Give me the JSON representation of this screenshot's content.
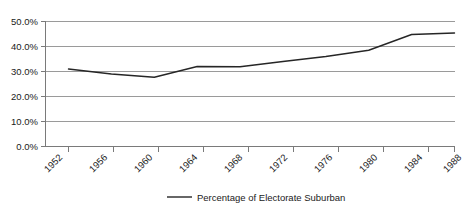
{
  "chart_data": {
    "type": "line",
    "title": "",
    "subtitle": "",
    "xlabel": "",
    "ylabel": "",
    "categories": [
      "1952",
      "1956",
      "1960",
      "1964",
      "1968",
      "1972",
      "1976",
      "1980",
      "1984",
      "1988"
    ],
    "x": [
      1952,
      1956,
      1960,
      1964,
      1968,
      1972,
      1976,
      1980,
      1984,
      1988
    ],
    "series": [
      {
        "name": "Percentage of Electorate Suburban",
        "values": [
          31.0,
          29.0,
          27.7,
          32.0,
          31.9,
          34.0,
          36.0,
          38.5,
          44.8,
          45.4
        ],
        "color": "#262626"
      }
    ],
    "ylim": [
      0,
      50
    ],
    "ytick_values": [
      0,
      10,
      20,
      30,
      40,
      50
    ],
    "ytick_labels": [
      "0.0%",
      "10.0%",
      "20.0%",
      "30.0%",
      "40.0%",
      "50.0%"
    ],
    "grid": true,
    "grid_axis": "y",
    "legend_position": "bottom",
    "xtick_label_rotation": -45
  },
  "legend": {
    "entries": [
      {
        "label": "Percentage of Electorate Suburban",
        "color": "#262626"
      }
    ]
  },
  "axes": {
    "y": {
      "labels": [
        "50.0%",
        "40.0%",
        "30.0%",
        "20.0%",
        "10.0%",
        "0.0%"
      ]
    },
    "x": {
      "labels": [
        "1952",
        "1956",
        "1960",
        "1964",
        "1968",
        "1972",
        "1976",
        "1980",
        "1984",
        "1988"
      ]
    }
  }
}
